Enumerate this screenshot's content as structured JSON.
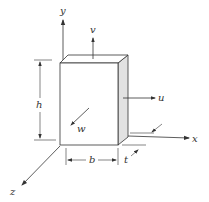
{
  "diagram": {
    "axes": {
      "x": "x",
      "y": "y",
      "z": "z"
    },
    "displacements": {
      "u": "u",
      "v": "v",
      "w": "w"
    },
    "dimensions": {
      "height": "h",
      "width": "b",
      "thickness": "t"
    },
    "colors": {
      "line": "#333333",
      "side_face": "#e2e2e2",
      "background": "#ffffff"
    }
  }
}
